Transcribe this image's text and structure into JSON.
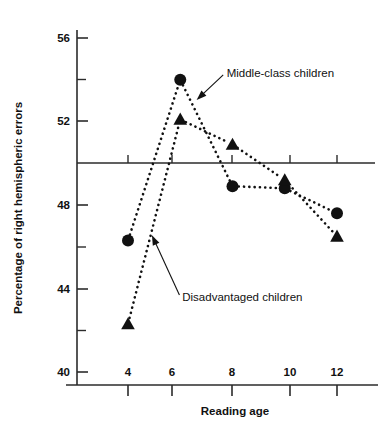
{
  "chart_data": {
    "type": "line",
    "title": "",
    "subtitle": "",
    "xlabel": "Reading age",
    "ylabel": "Percentage of right hemispheric errors",
    "x": [
      4,
      6,
      8,
      10,
      12
    ],
    "xticklabels": [
      "4",
      "6",
      "8",
      "10",
      "12"
    ],
    "yticklabels": [
      "40",
      "44",
      "48",
      "52",
      "56"
    ],
    "yticks": [
      40,
      44,
      48,
      52,
      56
    ],
    "yminorticks": [
      42,
      46,
      54
    ],
    "ylim": [
      39.2,
      56.8
    ],
    "xlim": [
      2.7,
      13.4
    ],
    "grid": false,
    "legend_position": "inline-annotations",
    "reference_line_y": 50,
    "series": [
      {
        "name": "Middle-class children",
        "marker": "circle",
        "linestyle": "dotted",
        "color": "#111111",
        "values": [
          46.3,
          54.0,
          48.9,
          48.8,
          47.6
        ]
      },
      {
        "name": "Disadvantaged children",
        "marker": "triangle",
        "linestyle": "dotted",
        "color": "#111111",
        "values": [
          42.3,
          52.1,
          50.9,
          49.2,
          46.5
        ]
      }
    ],
    "annotations": [
      {
        "text": "Middle-class children",
        "target_x": 6.6,
        "target_y": 53.0,
        "label_x": 7.7,
        "label_y": 54.3
      },
      {
        "text": "Disadvantaged children",
        "target_x": 4.9,
        "target_y": 46.6,
        "label_x": 6.0,
        "label_y": 43.6
      }
    ]
  }
}
